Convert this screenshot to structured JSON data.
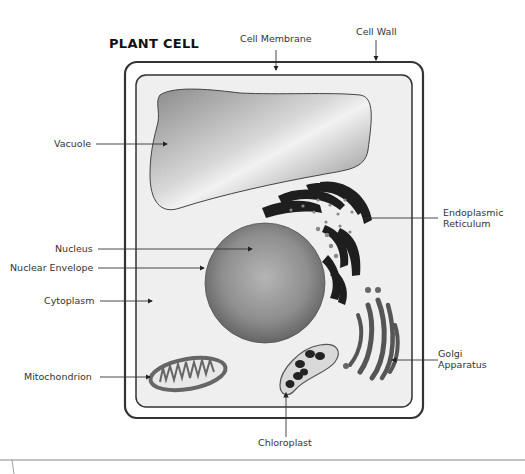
{
  "diagram": {
    "title": "PLANT CELL",
    "labels": {
      "cell_membrane": "Cell Membrane",
      "cell_wall": "Cell Wall",
      "vacuole": "Vacuole",
      "nucleus": "Nucleus",
      "nuclear_envelope": "Nuclear Envelope",
      "cytoplasm": "Cytoplasm",
      "mitochondrion": "Mitochondrion",
      "er_line1": "Endoplasmic",
      "er_line2": "Reticulum",
      "golgi_line1": "Golgi",
      "golgi_line2": "Apparatus",
      "chloroplast": "Chloroplast"
    },
    "colors": {
      "outline": "#333333",
      "cytoplasm_fill": "#efefef",
      "organelle_dark": "#1e1e1e",
      "golgi": "#555555",
      "leader_line": "#333333"
    }
  }
}
